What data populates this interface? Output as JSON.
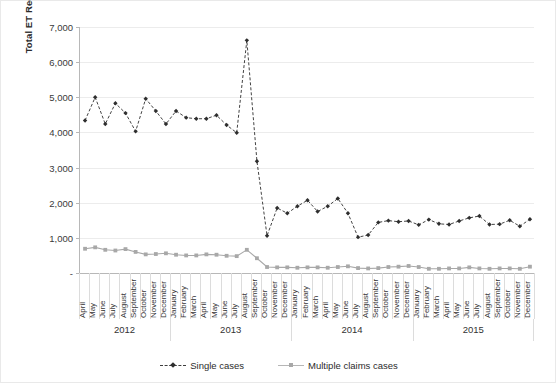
{
  "chart_data": {
    "type": "line",
    "title": "",
    "xlabel": "",
    "ylabel": "Total ET Reciepts",
    "ylim": [
      0,
      7000
    ],
    "ytick_values": [
      0,
      1000,
      2000,
      3000,
      4000,
      5000,
      6000,
      7000
    ],
    "ytick_labels": [
      "-",
      "1,000",
      "2,000",
      "3,000",
      "4,000",
      "5,000",
      "6,000",
      "7,000"
    ],
    "grid": true,
    "legend_position": "bottom",
    "categories": [
      "April",
      "May",
      "June",
      "July",
      "August",
      "September",
      "October",
      "November",
      "December",
      "January",
      "February",
      "March",
      "April",
      "May",
      "June",
      "July",
      "August",
      "September",
      "October",
      "November",
      "December",
      "January",
      "February",
      "March",
      "April",
      "May",
      "June",
      "July",
      "August",
      "September",
      "October",
      "November",
      "December",
      "January",
      "February",
      "March",
      "April",
      "May",
      "June",
      "July",
      "August",
      "September",
      "October",
      "November",
      "December"
    ],
    "year_groups": [
      {
        "label": "2012",
        "count": 9
      },
      {
        "label": "2013",
        "count": 12
      },
      {
        "label": "2014",
        "count": 12
      },
      {
        "label": "2015",
        "count": 12
      }
    ],
    "series": [
      {
        "name": "Single cases",
        "color": "#2e2e2e",
        "marker": "diamond",
        "linestyle": "dashed",
        "values": [
          4340,
          5000,
          4240,
          4830,
          4550,
          4030,
          4960,
          4610,
          4240,
          4610,
          4420,
          4390,
          4390,
          4490,
          4210,
          3990,
          6620,
          3180,
          1060,
          1850,
          1700,
          1900,
          2070,
          1750,
          1900,
          2120,
          1700,
          1020,
          1080,
          1440,
          1490,
          1460,
          1480,
          1370,
          1520,
          1400,
          1380,
          1480,
          1570,
          1620,
          1380,
          1390,
          1500,
          1330,
          1530
        ]
      },
      {
        "name": "Multiple claims cases",
        "color": "#a8a8a8",
        "marker": "square",
        "linestyle": "solid",
        "values": [
          690,
          730,
          660,
          640,
          680,
          600,
          530,
          540,
          560,
          520,
          500,
          500,
          530,
          520,
          490,
          480,
          660,
          420,
          170,
          160,
          160,
          150,
          160,
          160,
          150,
          170,
          190,
          140,
          130,
          140,
          170,
          180,
          200,
          170,
          120,
          120,
          130,
          130,
          160,
          130,
          120,
          130,
          130,
          120,
          180
        ]
      }
    ]
  },
  "legend": {
    "items": [
      {
        "label": "Single cases"
      },
      {
        "label": "Multiple claims cases"
      }
    ]
  }
}
